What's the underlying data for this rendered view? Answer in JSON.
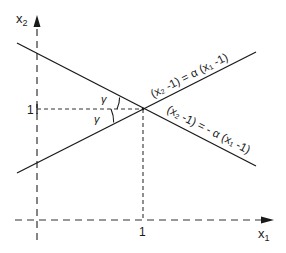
{
  "diagram": {
    "axes": {
      "x_label": "x",
      "x_sub": "1",
      "y_label": "x",
      "y_sub": "2",
      "x_tick": "1",
      "y_tick": "1"
    },
    "lines": [
      {
        "id": "positive-slope-line",
        "equation": "(x₂ -1) = α (x₁ -1)"
      },
      {
        "id": "negative-slope-line",
        "equation": "(x₂ -1) = - α (x₁ -1)"
      }
    ],
    "angles": [
      {
        "label": "γ",
        "position": "above-horizontal"
      },
      {
        "label": "γ",
        "position": "below-horizontal"
      }
    ],
    "intersection_point": {
      "x1": "1",
      "x2": "1"
    },
    "colors": {
      "stroke": "#1a1a1a",
      "background": "#ffffff"
    }
  }
}
